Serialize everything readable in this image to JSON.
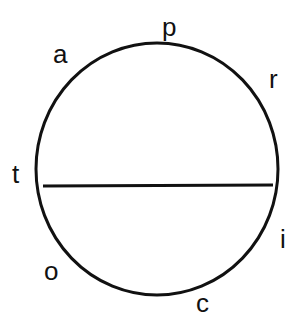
{
  "diagram": {
    "type": "circle-with-chord",
    "stroke_color": "#111111",
    "background": "#ffffff",
    "circle": {
      "cx": 157,
      "cy": 169,
      "rx": 121,
      "ry": 126,
      "stroke_width": 3
    },
    "chord": {
      "x1": 43,
      "y1": 186,
      "x2": 273,
      "y2": 185,
      "stroke_width": 3
    },
    "labels": [
      {
        "id": "p",
        "text": "p",
        "x": 162,
        "y": 36
      },
      {
        "id": "a",
        "text": "a",
        "x": 53,
        "y": 63
      },
      {
        "id": "r",
        "text": "r",
        "x": 269,
        "y": 88
      },
      {
        "id": "t",
        "text": "t",
        "x": 12,
        "y": 183
      },
      {
        "id": "i",
        "text": "i",
        "x": 280,
        "y": 248
      },
      {
        "id": "o",
        "text": "o",
        "x": 44,
        "y": 280
      },
      {
        "id": "c",
        "text": "c",
        "x": 196,
        "y": 312
      }
    ]
  }
}
